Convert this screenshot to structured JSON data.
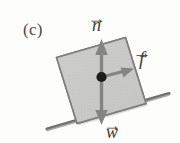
{
  "figure": {
    "panel_label": "(c)",
    "background_color": "#fdfdfc",
    "block": {
      "name": "inclined-block",
      "fill_color": "#c9c9c7",
      "edge_color": "#8c8c8a",
      "tilt_degrees": -17
    },
    "ground": {
      "name": "inclined-surface",
      "color": "#6e6e6c",
      "slope_label": "incline"
    },
    "center_dot": {
      "color": "#1a1a1a"
    },
    "vectors": [
      {
        "id": "normal",
        "symbol": "n",
        "arrow_accent": "→",
        "direction": "up",
        "color": "#7a7a78"
      },
      {
        "id": "friction",
        "symbol": "f",
        "arrow_accent": "→",
        "direction": "right",
        "color": "#7a7a78"
      },
      {
        "id": "weight",
        "symbol": "w",
        "arrow_accent": "→",
        "direction": "down",
        "color": "#7a7a78"
      }
    ]
  }
}
